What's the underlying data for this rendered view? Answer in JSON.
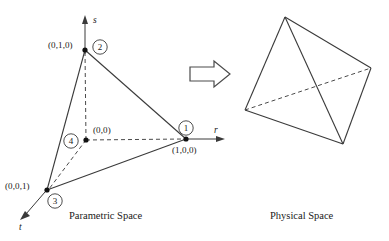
{
  "figure": {
    "title_left": "Parametric Space",
    "title_right": "Physical Space",
    "transform_arrow": "right-block-arrow",
    "line_color": "#3a3a3a",
    "dash_color": "#4a4a4a",
    "node_color": "#111111",
    "background": "#ffffff"
  },
  "parametric": {
    "axes": [
      {
        "name": "s",
        "label": "s",
        "direction": "up"
      },
      {
        "name": "r",
        "label": "r",
        "direction": "right"
      },
      {
        "name": "t",
        "label": "t",
        "direction": "down-left"
      }
    ],
    "nodes": [
      {
        "id": "1",
        "number": "1",
        "coord_label": "(1,0,0)",
        "x": 186,
        "y": 139
      },
      {
        "id": "2",
        "number": "2",
        "coord_label": "(0,1,0)",
        "x": 85,
        "y": 50
      },
      {
        "id": "3",
        "number": "3",
        "coord_label": "(0,0,1)",
        "x": 47,
        "y": 190
      },
      {
        "id": "4",
        "number": "4",
        "coord_label": "(0,0)",
        "x": 86,
        "y": 140
      }
    ],
    "solid_edges": [
      {
        "from": "2",
        "to": "1"
      },
      {
        "from": "2",
        "to": "3"
      },
      {
        "from": "3",
        "to": "1"
      }
    ],
    "dashed_edges": [
      {
        "from": "4",
        "to": "2"
      },
      {
        "from": "4",
        "to": "1"
      },
      {
        "from": "4",
        "to": "3"
      }
    ]
  },
  "physical": {
    "vertices": [
      {
        "id": "pA",
        "x": 285,
        "y": 17
      },
      {
        "id": "pB",
        "x": 371,
        "y": 68
      },
      {
        "id": "pC",
        "x": 343,
        "y": 144
      },
      {
        "id": "pD",
        "x": 245,
        "y": 110
      }
    ],
    "solid_edges": [
      {
        "from": "pA",
        "to": "pB"
      },
      {
        "from": "pB",
        "to": "pC"
      },
      {
        "from": "pC",
        "to": "pD"
      },
      {
        "from": "pD",
        "to": "pA"
      },
      {
        "from": "pA",
        "to": "pC"
      }
    ],
    "dashed_edges": [
      {
        "from": "pD",
        "to": "pB"
      }
    ]
  }
}
